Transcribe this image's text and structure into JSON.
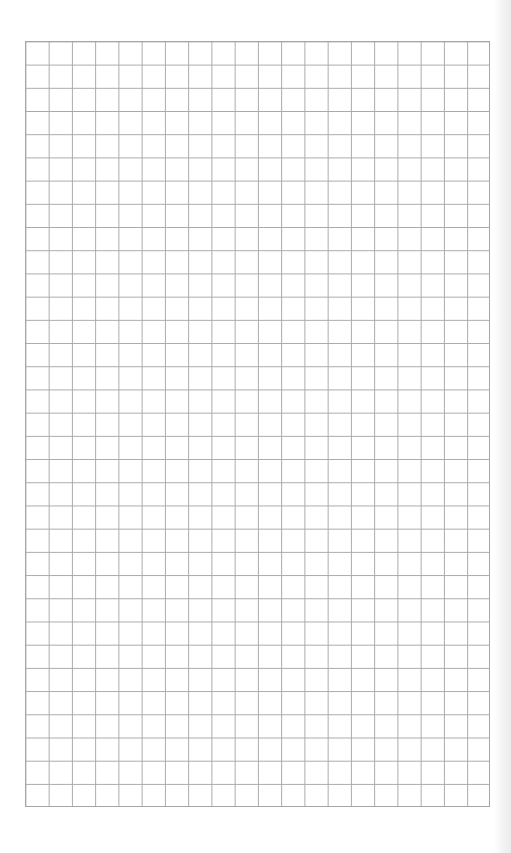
{
  "page": {
    "type": "graph-paper",
    "background_color": "#ffffff",
    "grid": {
      "columns": 20,
      "rows": 33,
      "line_color": "#a9a9a9",
      "cell_size_px": 23.25
    }
  }
}
